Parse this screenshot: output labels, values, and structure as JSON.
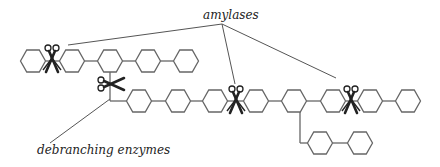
{
  "labels": {
    "amylases": "amylases",
    "debranching": "debranching enzymes"
  },
  "colors": {
    "stroke": "#666666",
    "line": "#555555",
    "scissors": "#222222",
    "text": "#222222"
  },
  "top_chain": {
    "y": 61,
    "xs": [
      33,
      72,
      110,
      148,
      186
    ]
  },
  "main_chain": {
    "y": 101,
    "xs": [
      139,
      178,
      215,
      256,
      294,
      333,
      370,
      408
    ]
  },
  "branch_chain": {
    "y": 143,
    "xs": [
      320,
      360
    ]
  },
  "scissors": [
    {
      "name": "amylase-scissors-1",
      "x": 52,
      "y": 60
    },
    {
      "name": "amylase-scissors-2",
      "x": 236,
      "y": 101
    },
    {
      "name": "amylase-scissors-3",
      "x": 351,
      "y": 101
    },
    {
      "name": "debranching-scissors",
      "x": 112,
      "y": 84
    }
  ]
}
